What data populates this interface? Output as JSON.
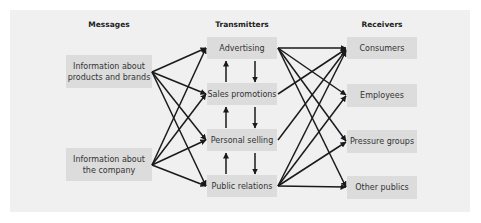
{
  "columns": {
    "messages": "Messages",
    "transmitters": "Transmitters",
    "receivers": "Receivers"
  },
  "messages": [
    {
      "label": "Information about products and brands"
    },
    {
      "label": "Information about the company"
    }
  ],
  "transmitters": [
    {
      "label": "Advertising"
    },
    {
      "label": "Sales promotions"
    },
    {
      "label": "Personal selling"
    },
    {
      "label": "Public relations"
    }
  ],
  "receivers": [
    {
      "label": "Consumers"
    },
    {
      "label": "Employees"
    },
    {
      "label": "Pressure groups"
    },
    {
      "label": "Other publics"
    }
  ],
  "connections": {
    "messages_to_transmitters": "each message -> all transmitters",
    "transmitter_chain": "bidirectional vertical arrows between adjacent transmitters",
    "transmitters_to_receivers": [
      {
        "from": "Advertising",
        "to": [
          "Consumers",
          "Employees",
          "Pressure groups",
          "Other publics"
        ]
      },
      {
        "from": "Sales promotions",
        "to": [
          "Consumers"
        ]
      },
      {
        "from": "Personal selling",
        "to": [
          "Consumers"
        ]
      },
      {
        "from": "Public relations",
        "to": [
          "Consumers",
          "Employees",
          "Pressure groups",
          "Other publics"
        ]
      }
    ]
  },
  "colors": {
    "panel": "#f0f0f0",
    "box": "#dcdcdc",
    "arrow": "#1a1a1a"
  }
}
